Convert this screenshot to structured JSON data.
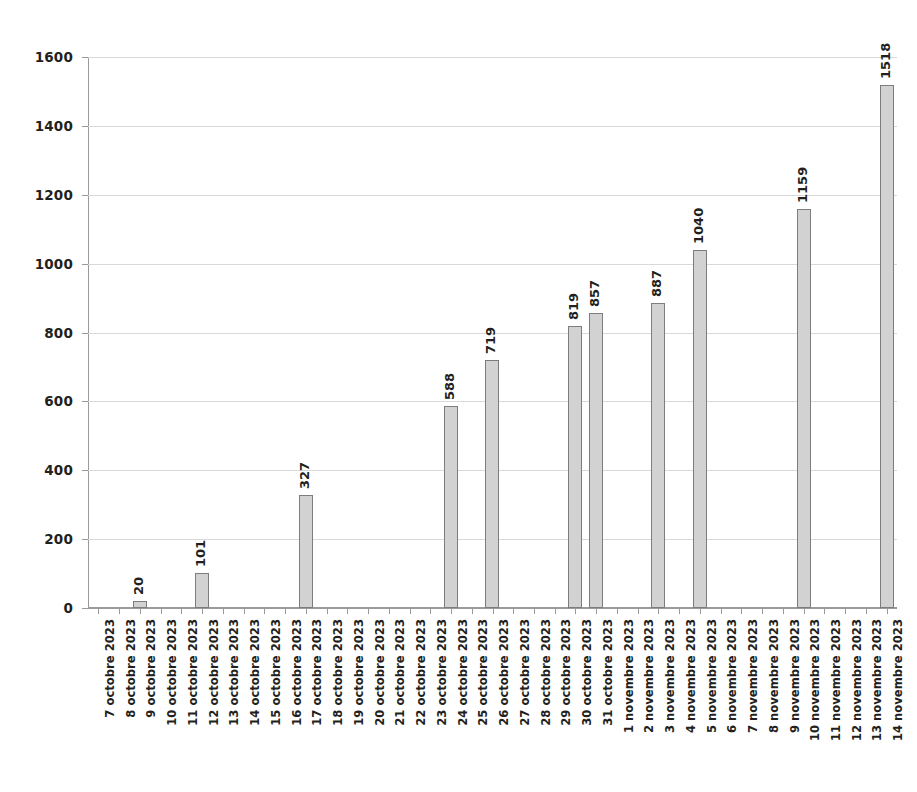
{
  "chart_data": {
    "type": "bar",
    "title": "",
    "subtitle": "",
    "xlabel": "",
    "ylabel": "",
    "ylim": [
      0,
      1600
    ],
    "ytick_step": 200,
    "yticks": [
      0,
      200,
      400,
      600,
      800,
      1000,
      1200,
      1400,
      1600
    ],
    "grid": "horizontal",
    "legend": "none",
    "bar_fill_color": "#d2d2d2",
    "bar_border_color": "#7d7d7d",
    "gridline_color": "#d9d9d9",
    "axis_color": "#9a9a9a",
    "text_color": "#231f20",
    "value_labels_shown": true,
    "value_label_rotation": "vertical",
    "xtick_label_rotation": "vertical",
    "categories": [
      "7 octobre 2023",
      "8 octobre 2023",
      "9 octobre 2023",
      "10 octobre 2023",
      "11 octobre 2023",
      "12 octobre 2023",
      "13 octobre 2023",
      "14 octobre 2023",
      "15 octobre 2023",
      "16 octobre 2023",
      "17 octobre 2023",
      "18 octobre 2023",
      "19 octobre 2023",
      "20 octobre 2023",
      "21 octobre 2023",
      "22 octobre 2023",
      "23 octobre 2023",
      "24 octobre 2023",
      "25 octobre 2023",
      "26 octobre 2023",
      "27 octobre 2023",
      "28 octobre 2023",
      "29 octobre 2023",
      "30 octobre 2023",
      "31 octobre 2023",
      "1 novembre 2023",
      "2 novembre 2023",
      "3 novembre 2023",
      "4 novembre 2023",
      "5 novembre 2023",
      "6 novembre 2023",
      "7 novembre 2023",
      "8 novembre 2023",
      "9 novembre 2023",
      "10 novembre 2023",
      "11 novembre 2023",
      "12 novembre 2023",
      "13 novembre 2023",
      "14 novembre 2023"
    ],
    "values": [
      null,
      null,
      20,
      null,
      null,
      101,
      null,
      null,
      null,
      null,
      327,
      null,
      null,
      null,
      null,
      null,
      null,
      588,
      null,
      719,
      null,
      null,
      null,
      819,
      857,
      null,
      null,
      887,
      null,
      1040,
      null,
      null,
      null,
      null,
      1159,
      null,
      null,
      null,
      1518
    ],
    "labeled_points": [
      {
        "category": "9 octobre 2023",
        "value": 20
      },
      {
        "category": "12 octobre 2023",
        "value": 101
      },
      {
        "category": "17 octobre 2023",
        "value": 327
      },
      {
        "category": "24 octobre 2023",
        "value": 588
      },
      {
        "category": "26 octobre 2023",
        "value": 719
      },
      {
        "category": "30 octobre 2023",
        "value": 819
      },
      {
        "category": "31 octobre 2023",
        "value": 857
      },
      {
        "category": "3 novembre 2023",
        "value": 887
      },
      {
        "category": "5 novembre 2023",
        "value": 1040
      },
      {
        "category": "10 novembre 2023",
        "value": 1159
      },
      {
        "category": "14 novembre 2023",
        "value": 1518
      }
    ]
  }
}
